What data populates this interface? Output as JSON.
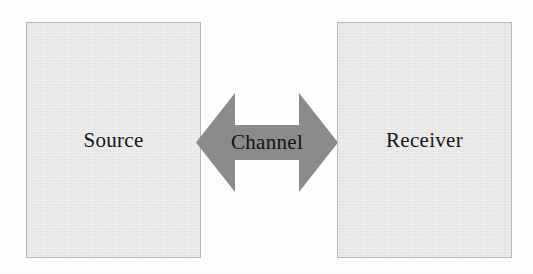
{
  "diagram": {
    "background_color": "#ffffff",
    "nodes": [
      {
        "id": "source",
        "label": "Source",
        "fill_color": "#e9e9e9",
        "border_color": "#b9b9b9",
        "text_color": "#161616"
      },
      {
        "id": "receiver",
        "label": "Receiver",
        "fill_color": "#e9e9e9",
        "border_color": "#b9b9b9",
        "text_color": "#161616"
      }
    ],
    "connector": {
      "id": "channel",
      "label": "Channel",
      "icon": "double-headed-arrow-icon",
      "direction": "bidirectional",
      "fill_color": "#8c8c8c",
      "text_color": "#141414"
    }
  }
}
